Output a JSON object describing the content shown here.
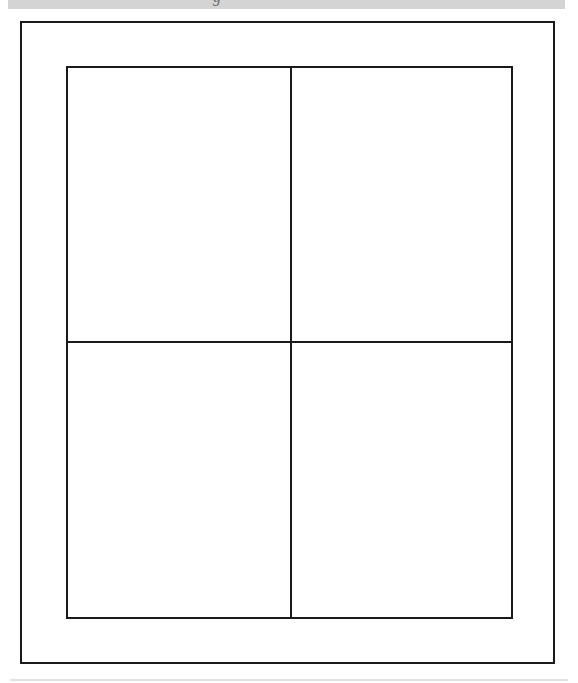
{
  "header": {
    "cropped_text": "g"
  },
  "page": {
    "layout": "four-panel grid",
    "panels": [
      {
        "position": "top-left",
        "content": ""
      },
      {
        "position": "top-right",
        "content": ""
      },
      {
        "position": "bottom-left",
        "content": ""
      },
      {
        "position": "bottom-right",
        "content": ""
      }
    ]
  },
  "colors": {
    "header_bar": "#d4d4d4",
    "line": "#1a1a1a",
    "background": "#ffffff"
  }
}
